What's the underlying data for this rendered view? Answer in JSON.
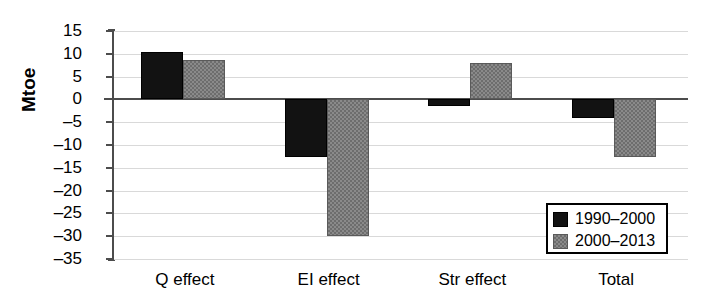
{
  "chart_data": {
    "type": "bar",
    "title": "",
    "xlabel": "",
    "ylabel": "Mtoe",
    "ylim": [
      -35,
      15
    ],
    "ytick_step": 5,
    "grid": true,
    "legend_position": "bottom-right",
    "categories": [
      "Q effect",
      "EI effect",
      "Str effect",
      "Total"
    ],
    "yticks": [
      "15",
      "10",
      "5",
      "0",
      "–5",
      "–10",
      "–15",
      "–20",
      "–25",
      "–30",
      "–35"
    ],
    "series": [
      {
        "name": "1990–2000",
        "color": "#121212",
        "values": [
          10.2,
          -12.5,
          -1.3,
          -3.8
        ]
      },
      {
        "name": "2000–2013",
        "color": "#8a8a8a",
        "values": [
          8.4,
          -29.7,
          7.7,
          -12.5
        ]
      }
    ]
  },
  "legend": {
    "items": [
      {
        "label": "1990–2000"
      },
      {
        "label": "2000–2013"
      }
    ]
  }
}
